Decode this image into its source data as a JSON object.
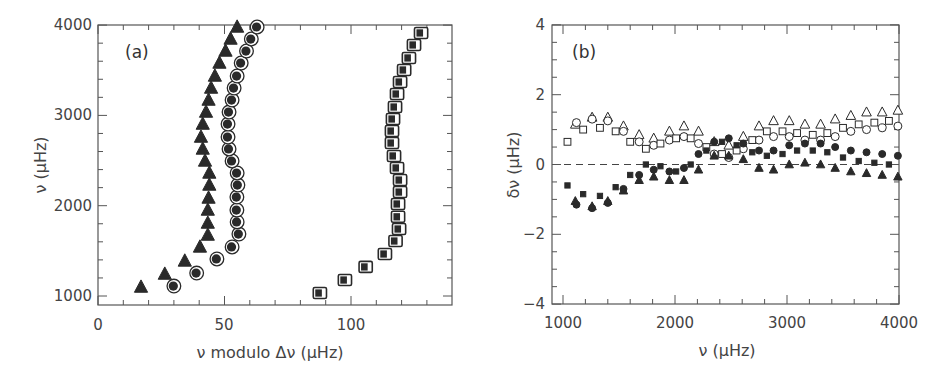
{
  "chart_data": [
    {
      "panel": "a",
      "type": "scatter",
      "title": "",
      "panel_label": "(a)",
      "xlabel": "ν modulo Δν (μHz)",
      "ylabel": "ν (μHz)",
      "xlim": [
        0,
        140
      ],
      "ylim": [
        900,
        4000
      ],
      "xticks": [
        0,
        50,
        100
      ],
      "yticks": [
        1000,
        2000,
        3000,
        4000
      ],
      "grid": false,
      "series": [
        {
          "name": "triangles (l=2)",
          "marker": "triangle-filled",
          "points": [
            [
              17,
              1099
            ],
            [
              26.4,
              1243
            ],
            [
              34.3,
              1388
            ],
            [
              40.3,
              1543
            ],
            [
              43.4,
              1675
            ],
            [
              43.4,
              1808
            ],
            [
              43.4,
              1952
            ],
            [
              43.7,
              2085
            ],
            [
              44,
              2229
            ],
            [
              44,
              2362
            ],
            [
              42.3,
              2495
            ],
            [
              41.4,
              2628
            ],
            [
              40.7,
              2760
            ],
            [
              41.4,
              2904
            ],
            [
              42.7,
              3037
            ],
            [
              43.7,
              3170
            ],
            [
              44.7,
              3303
            ],
            [
              46.2,
              3436
            ],
            [
              48,
              3580
            ],
            [
              50.4,
              3713
            ],
            [
              52.4,
              3846
            ],
            [
              55,
              3979
            ]
          ]
        },
        {
          "name": "circles (l=0)",
          "marker": "circle-ringed",
          "points": [
            [
              30,
              1110
            ],
            [
              39,
              1254
            ],
            [
              47,
              1410
            ],
            [
              53,
              1543
            ],
            [
              55.7,
              1686
            ],
            [
              55,
              1820
            ],
            [
              54.9,
              1952
            ],
            [
              54.9,
              2096
            ],
            [
              55.3,
              2229
            ],
            [
              55,
              2362
            ],
            [
              53,
              2495
            ],
            [
              51.8,
              2628
            ],
            [
              51.4,
              2760
            ],
            [
              51.4,
              2904
            ],
            [
              51.8,
              3037
            ],
            [
              53,
              3170
            ],
            [
              53.8,
              3303
            ],
            [
              55,
              3436
            ],
            [
              56.6,
              3580
            ],
            [
              58.7,
              3713
            ],
            [
              60.6,
              3846
            ],
            [
              62.9,
              3979
            ]
          ]
        },
        {
          "name": "squares (l=1)",
          "marker": "square-ringed",
          "points": [
            [
              87.7,
              1033
            ],
            [
              97.6,
              1177
            ],
            [
              105.8,
              1322
            ],
            [
              113.4,
              1465
            ],
            [
              117.6,
              1609
            ],
            [
              119,
              1742
            ],
            [
              118.6,
              1877
            ],
            [
              118.6,
              2019
            ],
            [
              119.4,
              2151
            ],
            [
              119.4,
              2284
            ],
            [
              118.2,
              2418
            ],
            [
              117,
              2551
            ],
            [
              116.2,
              2694
            ],
            [
              116.2,
              2827
            ],
            [
              116.6,
              2960
            ],
            [
              117.4,
              3093
            ],
            [
              118.2,
              3237
            ],
            [
              119.4,
              3370
            ],
            [
              121,
              3503
            ],
            [
              122.9,
              3636
            ],
            [
              124.9,
              3780
            ],
            [
              127.7,
              3913
            ]
          ]
        }
      ]
    },
    {
      "panel": "b",
      "type": "scatter",
      "title": "",
      "panel_label": "(b)",
      "xlabel": "ν (μHz)",
      "ylabel": "δν (μHz)",
      "xlim": [
        900,
        4000
      ],
      "ylim": [
        -4,
        4
      ],
      "xticks": [
        1000,
        2000,
        3000,
        4000
      ],
      "yticks": [
        -4,
        -2,
        0,
        2,
        4
      ],
      "grid": false,
      "reference_line": {
        "y": 0,
        "style": "dashed"
      },
      "series": [
        {
          "name": "open triangles",
          "marker": "triangle-open",
          "points": [
            [
              1110,
              1.15
            ],
            [
              1260,
              1.35
            ],
            [
              1400,
              1.35
            ],
            [
              1540,
              1.1
            ],
            [
              1680,
              0.85
            ],
            [
              1810,
              0.75
            ],
            [
              1950,
              0.95
            ],
            [
              2080,
              1.1
            ],
            [
              2210,
              0.95
            ],
            [
              2350,
              0.65
            ],
            [
              2480,
              0.55
            ],
            [
              2610,
              0.8
            ],
            [
              2750,
              1.1
            ],
            [
              2880,
              1.25
            ],
            [
              3020,
              1.25
            ],
            [
              3160,
              1.15
            ],
            [
              3300,
              1.15
            ],
            [
              3430,
              1.3
            ],
            [
              3570,
              1.4
            ],
            [
              3710,
              1.5
            ],
            [
              3850,
              1.5
            ],
            [
              3990,
              1.55
            ]
          ]
        },
        {
          "name": "open circles",
          "marker": "circle-open",
          "points": [
            [
              1120,
              1.2
            ],
            [
              1260,
              1.3
            ],
            [
              1400,
              1.25
            ],
            [
              1540,
              0.95
            ],
            [
              1680,
              0.65
            ],
            [
              1810,
              0.55
            ],
            [
              1950,
              0.7
            ],
            [
              2080,
              0.8
            ],
            [
              2210,
              0.6
            ],
            [
              2350,
              0.3
            ],
            [
              2480,
              0.2
            ],
            [
              2610,
              0.45
            ],
            [
              2750,
              0.7
            ],
            [
              2880,
              0.8
            ],
            [
              3020,
              0.8
            ],
            [
              3160,
              0.7
            ],
            [
              3300,
              0.7
            ],
            [
              3430,
              0.8
            ],
            [
              3570,
              0.95
            ],
            [
              3710,
              1.0
            ],
            [
              3850,
              1.05
            ],
            [
              3990,
              1.1
            ]
          ]
        },
        {
          "name": "open squares",
          "marker": "square-open",
          "points": [
            [
              1040,
              0.65
            ],
            [
              1180,
              1.0
            ],
            [
              1330,
              1.05
            ],
            [
              1470,
              0.95
            ],
            [
              1600,
              0.65
            ],
            [
              1740,
              0.45
            ],
            [
              1870,
              0.6
            ],
            [
              2010,
              0.75
            ],
            [
              2140,
              0.75
            ],
            [
              2280,
              0.5
            ],
            [
              2420,
              0.3
            ],
            [
              2550,
              0.4
            ],
            [
              2690,
              0.7
            ],
            [
              2820,
              0.95
            ],
            [
              2960,
              0.95
            ],
            [
              3090,
              0.9
            ],
            [
              3230,
              0.85
            ],
            [
              3360,
              0.9
            ],
            [
              3500,
              1.05
            ],
            [
              3640,
              1.15
            ],
            [
              3780,
              1.2
            ],
            [
              3910,
              1.25
            ]
          ]
        },
        {
          "name": "filled circles",
          "marker": "circle-filled",
          "points": [
            [
              1120,
              -1.15
            ],
            [
              1260,
              -1.25
            ],
            [
              1400,
              -1.1
            ],
            [
              1540,
              -0.7
            ],
            [
              1680,
              -0.3
            ],
            [
              1810,
              -0.15
            ],
            [
              1950,
              -0.2
            ],
            [
              2080,
              -0.1
            ],
            [
              2210,
              0.3
            ],
            [
              2350,
              0.65
            ],
            [
              2480,
              0.75
            ],
            [
              2610,
              0.6
            ],
            [
              2750,
              0.4
            ],
            [
              2880,
              0.4
            ],
            [
              3020,
              0.55
            ],
            [
              3160,
              0.6
            ],
            [
              3300,
              0.6
            ],
            [
              3430,
              0.5
            ],
            [
              3570,
              0.4
            ],
            [
              3710,
              0.35
            ],
            [
              3850,
              0.3
            ],
            [
              3990,
              0.25
            ]
          ]
        },
        {
          "name": "filled squares",
          "marker": "square-filled",
          "points": [
            [
              1040,
              -0.6
            ],
            [
              1180,
              -0.85
            ],
            [
              1330,
              -0.9
            ],
            [
              1470,
              -0.65
            ],
            [
              1600,
              -0.3
            ],
            [
              1740,
              0.0
            ],
            [
              1870,
              -0.05
            ],
            [
              2010,
              -0.2
            ],
            [
              2140,
              0.0
            ],
            [
              2280,
              0.4
            ],
            [
              2420,
              0.65
            ],
            [
              2550,
              0.55
            ],
            [
              2690,
              0.35
            ],
            [
              2820,
              0.25
            ],
            [
              2960,
              0.3
            ],
            [
              3090,
              0.4
            ],
            [
              3230,
              0.4
            ],
            [
              3360,
              0.35
            ],
            [
              3500,
              0.2
            ],
            [
              3640,
              0.1
            ],
            [
              3780,
              0.05
            ],
            [
              3910,
              0.0
            ]
          ]
        },
        {
          "name": "filled triangles",
          "marker": "triangle-filled",
          "points": [
            [
              1110,
              -1.05
            ],
            [
              1260,
              -1.2
            ],
            [
              1400,
              -1.05
            ],
            [
              1540,
              -0.75
            ],
            [
              1680,
              -0.45
            ],
            [
              1810,
              -0.35
            ],
            [
              1950,
              -0.45
            ],
            [
              2080,
              -0.45
            ],
            [
              2210,
              -0.15
            ],
            [
              2350,
              0.25
            ],
            [
              2480,
              0.25
            ],
            [
              2610,
              0.15
            ],
            [
              2750,
              -0.1
            ],
            [
              2880,
              -0.15
            ],
            [
              3020,
              0.0
            ],
            [
              3160,
              0.05
            ],
            [
              3300,
              0.0
            ],
            [
              3430,
              -0.1
            ],
            [
              3570,
              -0.2
            ],
            [
              3710,
              -0.25
            ],
            [
              3850,
              -0.3
            ],
            [
              3990,
              -0.35
            ]
          ]
        }
      ]
    }
  ],
  "panels": {
    "a": {
      "label": "(a)",
      "xlabel": "ν modulo Δν (μHz)",
      "ylabel": "ν (μHz)",
      "xtick_labels": [
        "0",
        "50",
        "100"
      ],
      "ytick_labels": [
        "1000",
        "2000",
        "3000",
        "4000"
      ]
    },
    "b": {
      "label": "(b)",
      "xlabel": "ν (μHz)",
      "ylabel": "δν (μHz)",
      "xtick_labels": [
        "1000",
        "2000",
        "3000",
        "4000"
      ],
      "ytick_labels": [
        "−4",
        "−2",
        "0",
        "2",
        "4"
      ]
    }
  }
}
